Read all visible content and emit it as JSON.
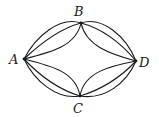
{
  "diagram": {
    "type": "graph",
    "vertices": [
      {
        "id": "A",
        "label": "A",
        "x": 24,
        "y": 59,
        "label_x": 9,
        "label_y": 64
      },
      {
        "id": "B",
        "label": "B",
        "x": 81,
        "y": 23,
        "label_x": 74,
        "label_y": 16
      },
      {
        "id": "C",
        "label": "C",
        "x": 80,
        "y": 96,
        "label_x": 73,
        "label_y": 113
      },
      {
        "id": "D",
        "label": "D",
        "x": 136,
        "y": 61,
        "label_x": 139,
        "label_y": 67
      }
    ],
    "edges": [
      {
        "from": "A",
        "to": "B",
        "shape": "outer-convex"
      },
      {
        "from": "A",
        "to": "B",
        "shape": "inner-convex"
      },
      {
        "from": "A",
        "to": "B",
        "shape": "concave"
      },
      {
        "from": "B",
        "to": "D",
        "shape": "outer-convex"
      },
      {
        "from": "B",
        "to": "D",
        "shape": "inner-convex"
      },
      {
        "from": "B",
        "to": "D",
        "shape": "concave"
      },
      {
        "from": "A",
        "to": "C",
        "shape": "outer-convex"
      },
      {
        "from": "A",
        "to": "C",
        "shape": "inner-convex"
      },
      {
        "from": "A",
        "to": "C",
        "shape": "concave"
      },
      {
        "from": "C",
        "to": "D",
        "shape": "outer-convex"
      },
      {
        "from": "C",
        "to": "D",
        "shape": "inner-convex"
      },
      {
        "from": "C",
        "to": "D",
        "shape": "concave"
      }
    ],
    "colors": {
      "stroke": "#1a1a1a",
      "background": "#ffffff"
    }
  }
}
